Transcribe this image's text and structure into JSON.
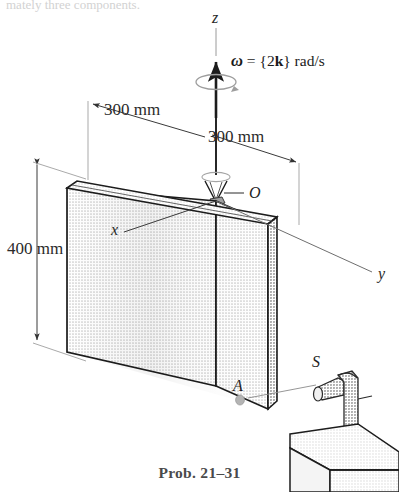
{
  "figure": {
    "caption": "Prob. 21–31",
    "top_partial_text": "mately three components.",
    "axes": [
      {
        "name": "z-axis-label",
        "text": "z"
      },
      {
        "name": "x-axis-label",
        "text": "x"
      },
      {
        "name": "y-axis-label",
        "text": "y"
      }
    ],
    "angular_velocity": {
      "symbol": "ω",
      "equals": "=",
      "open_brace": "{",
      "magnitude": "2",
      "unit_vector": "k",
      "close_brace": "}",
      "units": "rad/s",
      "full_text": "ω = {2k} rad/s"
    },
    "dimensions": [
      {
        "name": "plate-height",
        "value": "400 mm"
      },
      {
        "name": "plate-left-half-width",
        "value": "300 mm"
      },
      {
        "name": "plate-right-half-width",
        "value": "300 mm"
      }
    ],
    "points": [
      {
        "name": "pivot-point-o",
        "text": "O"
      },
      {
        "name": "plate-point-a",
        "text": "A"
      },
      {
        "name": "nozzle-point-s",
        "text": "S"
      }
    ],
    "colors": {
      "plate_face": "#e3e3e3",
      "plate_top_edge": "#d8d8d8",
      "plate_side_edge": "#c6c6c6",
      "nozzle_body": "#bdbdbd",
      "table_top": "#e0e0e0",
      "table_front": "#ededed",
      "outline": "#1c1c1c",
      "thin_line": "#555555",
      "caption": "#4a4a4a",
      "background": "#ffffff"
    }
  }
}
